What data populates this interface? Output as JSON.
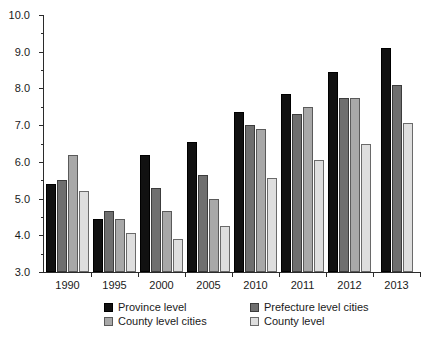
{
  "chart_data": {
    "type": "bar",
    "title": "",
    "subtitle": "",
    "xlabel": "",
    "ylabel": "",
    "categories": [
      "1990",
      "1995",
      "2000",
      "2005",
      "2010",
      "2011",
      "2012",
      "2013"
    ],
    "series": [
      {
        "name": "Province level",
        "color": "#111111",
        "values": [
          5.4,
          4.45,
          6.2,
          6.55,
          7.35,
          7.85,
          8.45,
          9.1
        ]
      },
      {
        "name": "Prefecture level cities",
        "color": "#6f6f6f",
        "values": [
          5.5,
          4.65,
          5.3,
          5.65,
          7.0,
          7.3,
          7.75,
          8.1
        ]
      },
      {
        "name": "County level cities",
        "color": "#a8a8a8",
        "values": [
          6.2,
          4.45,
          4.65,
          5.0,
          6.9,
          7.5,
          7.75,
          null
        ]
      },
      {
        "name": "County level",
        "color": "#dedede",
        "values": [
          5.2,
          4.05,
          3.9,
          4.25,
          5.55,
          6.05,
          6.5,
          7.05
        ]
      }
    ],
    "ylim": [
      3.0,
      10.0
    ],
    "ytick_labels": [
      "3.0",
      "4.0",
      "5.0",
      "6.0",
      "7.0",
      "8.0",
      "9.0",
      "10.0"
    ],
    "ytick_values": [
      3.0,
      4.0,
      5.0,
      6.0,
      7.0,
      8.0,
      9.0,
      10.0
    ],
    "yminor_values": [
      3.5,
      4.5,
      5.5,
      6.5,
      7.5,
      8.5,
      9.5
    ],
    "grid": false,
    "legend_position": "bottom"
  },
  "legend": {
    "items": [
      {
        "label": "Province level",
        "swatch": "s0"
      },
      {
        "label": "Prefecture level cities",
        "swatch": "s1"
      },
      {
        "label": "County level cities",
        "swatch": "s2"
      },
      {
        "label": "County level",
        "swatch": "s3"
      }
    ]
  }
}
